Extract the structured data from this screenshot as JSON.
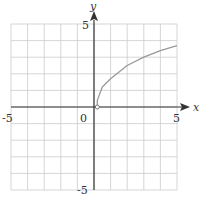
{
  "chart_data": {
    "type": "line",
    "title": "",
    "xlabel": "x",
    "ylabel": "y",
    "xlim": [
      -5,
      5
    ],
    "ylim": [
      -5,
      5
    ],
    "grid": true,
    "tick_labels": {
      "x_min": "-5",
      "x_max": "5",
      "y_min": "-5",
      "y_max": "5",
      "origin": "0"
    },
    "series": [
      {
        "name": "curve",
        "start_point": {
          "x": 0.2,
          "y": 0,
          "marker": "open-circle"
        },
        "x": [
          0.2,
          0.5,
          1,
          2,
          3,
          4,
          5
        ],
        "y": [
          0.4,
          1.2,
          1.7,
          2.5,
          3.0,
          3.4,
          3.7
        ]
      }
    ],
    "colors": {
      "grid": "#cccccc",
      "axis": "#333333",
      "curve": "#999999"
    }
  }
}
